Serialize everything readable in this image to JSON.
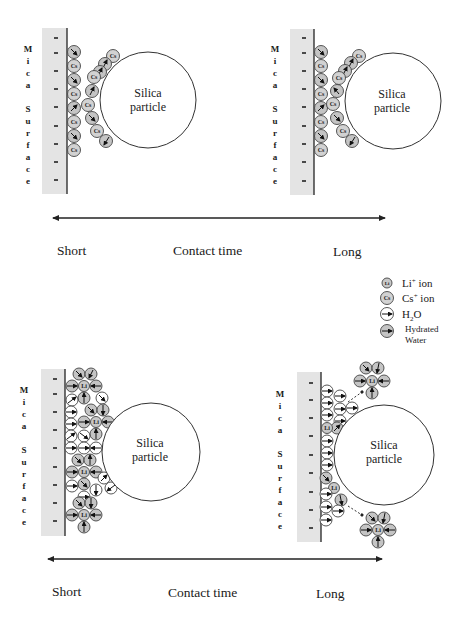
{
  "diagram": {
    "panels": [
      {
        "id": "cs-short",
        "surface_label": "Mica Surface",
        "surface_letters": [
          "M",
          "i",
          "c",
          "a",
          "",
          "S",
          "u",
          "r",
          "f",
          "a",
          "c",
          "e"
        ],
        "particle_label_line1": "Silica",
        "particle_label_line2": "particle",
        "cation": "Cs",
        "contact_time": "Short"
      },
      {
        "id": "cs-long",
        "surface_label": "Mica Surface",
        "particle_label_line1": "Silica",
        "particle_label_line2": "particle",
        "cation": "Cs",
        "contact_time": "Long"
      },
      {
        "id": "li-short",
        "surface_label": "Mica Surface",
        "particle_label_line1": "Silica",
        "particle_label_line2": "particle",
        "cation": "Li",
        "contact_time": "Short"
      },
      {
        "id": "li-long",
        "surface_label": "Mica Surface",
        "particle_label_line1": "Silica",
        "particle_label_line2": "particle",
        "cation": "Li",
        "contact_time": "Long"
      }
    ],
    "time_axis_top": {
      "left": "Short",
      "center": "Contact time",
      "right": "Long"
    },
    "time_axis_bottom": {
      "left": "Short",
      "center": "Contact time",
      "right": "Long"
    },
    "legend": {
      "items": [
        {
          "icon": "li-ion-icon",
          "symbol": "Li",
          "label": "Li",
          "sup": "+",
          "suffix": " ion"
        },
        {
          "icon": "cs-ion-icon",
          "symbol": "Cs",
          "label": "Cs",
          "sup": "+",
          "suffix": " ion"
        },
        {
          "icon": "water-molecule-icon",
          "label": "H",
          "sub": "2",
          "suffix": "O"
        },
        {
          "icon": "hydrated-water-icon",
          "label_line1": "Hydrated",
          "label_line2": "Water"
        }
      ]
    },
    "ion_symbols": {
      "cs": "Cs",
      "li": "Li"
    },
    "charge_symbol": "−",
    "colors": {
      "mica": "#e4e4e4",
      "ion_fill": "#d2d2d2",
      "hydrated_fill": "#c4c4c4",
      "water_fill": "#ffffff",
      "line": "#222222"
    }
  }
}
